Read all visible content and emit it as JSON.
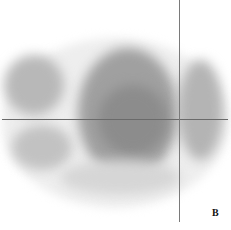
{
  "image": {
    "description": "Grayscale axial nuclear medicine scan slice with crosshair",
    "panel_label": "B",
    "crosshair": {
      "x": 179,
      "y": 119
    },
    "line_color": "#6a6a6a",
    "tissue_color": "#8a8a8a"
  }
}
